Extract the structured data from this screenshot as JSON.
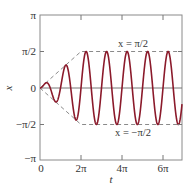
{
  "chart_data": {
    "type": "line",
    "title": "",
    "xlabel": "t",
    "ylabel": "x",
    "xlim": [
      0,
      6.9
    ],
    "xlim_units": "pi",
    "ylim": [
      -3.14159,
      3.14159
    ],
    "grid": false,
    "legend": null,
    "x_ticks": [
      {
        "value": 0,
        "label": "0"
      },
      {
        "value": 6.2832,
        "label": "2π"
      },
      {
        "value": 12.5664,
        "label": "4π"
      },
      {
        "value": 18.8496,
        "label": "6π"
      }
    ],
    "y_ticks": [
      {
        "value": 3.14159,
        "label": "π"
      },
      {
        "value": 1.5708,
        "label": "π/2"
      },
      {
        "value": 0,
        "label": "0"
      },
      {
        "value": -1.5708,
        "label": "−π/2"
      },
      {
        "value": -3.14159,
        "label": "−π"
      }
    ],
    "series": [
      {
        "name": "x(t)",
        "description": "oscillation x = A(t)·sin(2t); amplitude grows linearly A = t/4 until t = 2π, then saturates at π/2",
        "frequency": 2,
        "ramp_end_t": 6.2832,
        "max_amplitude": 1.5708,
        "color": "#8b1a2b",
        "style": "solid"
      },
      {
        "name": "upper envelope",
        "points": [
          [
            0,
            0
          ],
          [
            6.2832,
            1.5708
          ],
          [
            21.68,
            1.5708
          ]
        ],
        "color": "#888888",
        "style": "dashed"
      },
      {
        "name": "lower envelope",
        "points": [
          [
            0,
            0
          ],
          [
            6.2832,
            -1.5708
          ],
          [
            21.68,
            -1.5708
          ]
        ],
        "color": "#888888",
        "style": "dashed"
      }
    ],
    "annotations": [
      {
        "text": "x = π/2",
        "x": 15.2,
        "y": 1.5708,
        "position": "above"
      },
      {
        "text": "x = −π/2",
        "x": 15.2,
        "y": -1.5708,
        "position": "below"
      }
    ],
    "zero_line": true
  },
  "labels": {
    "xlabel": "t",
    "ylabel": "x",
    "y_pi": "π",
    "y_half_pi": "π/2",
    "y_zero": "0",
    "y_neg_half_pi": "−π/2",
    "y_neg_pi": "−π",
    "x_zero": "0",
    "x_2pi": "2π",
    "x_4pi": "4π",
    "x_6pi": "6π",
    "annot_upper": "x = π/2",
    "annot_lower": "x = −π/2"
  },
  "colors": {
    "curve": "#8b1a2b",
    "envelope": "#8a8a8a",
    "axis": "#777777",
    "zero_line": "#666666"
  }
}
